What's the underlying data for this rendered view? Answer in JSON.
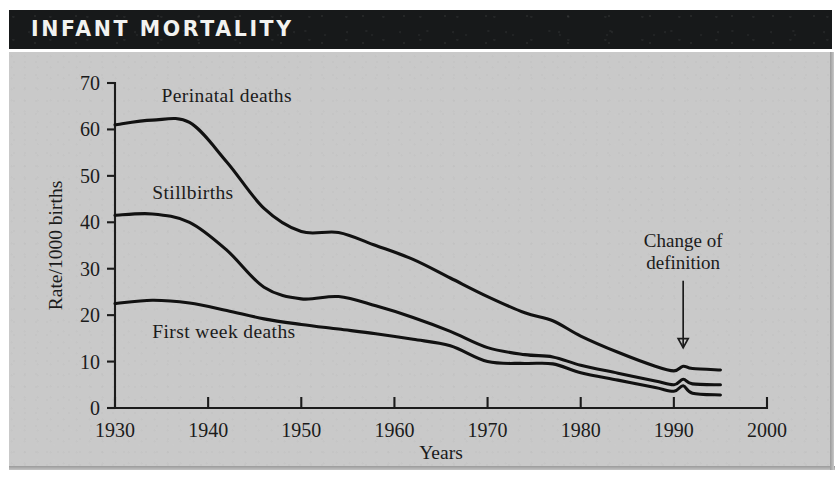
{
  "title": "INFANT MORTALITY",
  "chart_data": {
    "type": "line",
    "title": "INFANT MORTALITY",
    "xlabel": "Years",
    "ylabel": "Rate/1000 births",
    "xlim": [
      1930,
      2000
    ],
    "ylim": [
      0,
      70
    ],
    "xticks": [
      1930,
      1940,
      1950,
      1960,
      1970,
      1980,
      1990,
      2000
    ],
    "yticks": [
      0,
      10,
      20,
      30,
      40,
      50,
      60,
      70
    ],
    "grid": false,
    "legend_position": "inline-labels",
    "x": [
      1930,
      1934,
      1938,
      1942,
      1946,
      1950,
      1954,
      1958,
      1962,
      1966,
      1970,
      1974,
      1977,
      1980,
      1984,
      1988,
      1990,
      1991,
      1992,
      1995
    ],
    "series": [
      {
        "name": "Perinatal deaths",
        "label": "Perinatal deaths",
        "label_x": 1935,
        "label_y": 66,
        "values": [
          61.0,
          62.0,
          61.5,
          53.0,
          43.0,
          38.0,
          37.8,
          35.0,
          32.0,
          28.0,
          24.0,
          20.5,
          18.8,
          15.5,
          12.0,
          9.0,
          8.0,
          9.0,
          8.5,
          8.2
        ]
      },
      {
        "name": "Stillbirths",
        "label": "Stillbirths",
        "label_x": 1934,
        "label_y": 45,
        "values": [
          41.5,
          41.8,
          40.0,
          34.0,
          26.0,
          23.5,
          24.0,
          22.0,
          19.5,
          16.5,
          13.0,
          11.5,
          11.0,
          9.2,
          7.5,
          5.8,
          5.0,
          6.2,
          5.2,
          5.0
        ]
      },
      {
        "name": "First week deaths",
        "label": "First week deaths",
        "label_x": 1934,
        "label_y": 15,
        "values": [
          22.5,
          23.2,
          22.6,
          21.0,
          19.2,
          18.0,
          17.0,
          16.0,
          14.8,
          13.4,
          10.0,
          9.6,
          9.5,
          7.6,
          6.0,
          4.4,
          3.6,
          4.8,
          3.2,
          2.8
        ]
      }
    ],
    "annotations": [
      {
        "text_line1": "Change of",
        "text_line2": "definition",
        "x": 1991,
        "y": 30,
        "arrow_to_y": 13,
        "type": "arrow-annotation"
      }
    ]
  },
  "colors": {
    "title_bar": "#17191a",
    "title_text": "#f2f2f0",
    "panel_bg": "#c9c9c9",
    "ink": "#111111"
  }
}
